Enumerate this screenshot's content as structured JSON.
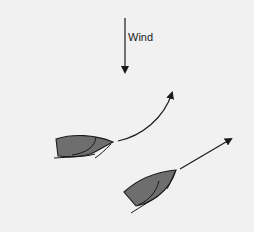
{
  "diagram": {
    "wind": {
      "label": "Wind",
      "direction": "down"
    },
    "boats": [
      {
        "id": "boat-1",
        "maneuver": "curved-turn-up",
        "hull_color": "#6e6e6e"
      },
      {
        "id": "boat-2",
        "maneuver": "straight-diagonal",
        "hull_color": "#6e6e6e"
      }
    ],
    "colors": {
      "background": "#f1f1f1",
      "line": "#1a1a1a",
      "hull_fill": "#6e6e6e"
    }
  }
}
